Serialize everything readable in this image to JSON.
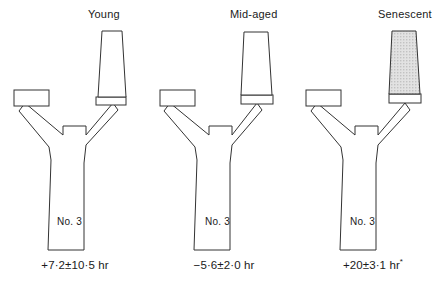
{
  "figure": {
    "type": "scientific-diagram",
    "background_color": "#ffffff",
    "stroke_color": "#333333",
    "shaded_fill_color": "#d8d8d8"
  },
  "panels": [
    {
      "id": "young",
      "title": "Young",
      "trunk_label": "No. 3",
      "caption": "+7·2±10·5 hr",
      "caption_marker": "",
      "column_shaded": false
    },
    {
      "id": "mid",
      "title": "Mid-aged",
      "trunk_label": "No. 3",
      "caption": "−5·6±2·0 hr",
      "caption_marker": "",
      "column_shaded": false
    },
    {
      "id": "senescent",
      "title": "Senescent",
      "trunk_label": "No. 3",
      "caption": "+20±3·1 hr",
      "caption_marker": "*",
      "column_shaded": true
    }
  ]
}
